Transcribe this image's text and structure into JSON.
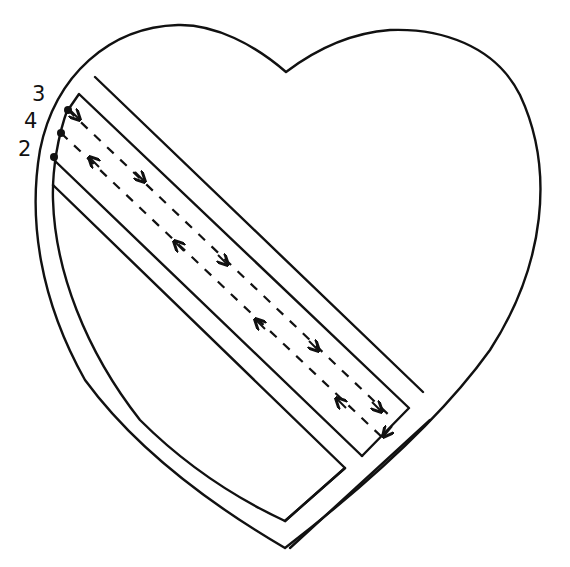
{
  "diagram": {
    "title": "",
    "shape": "heart",
    "stroke_color": "#111111",
    "background": "#ffffff",
    "labels": [
      {
        "id": "label-3",
        "text": "3",
        "x": 32,
        "y": 101
      },
      {
        "id": "label-4",
        "text": "4",
        "x": 24,
        "y": 128
      },
      {
        "id": "label-2",
        "text": "2",
        "x": 18,
        "y": 156
      }
    ],
    "points": [
      {
        "id": "point-3",
        "x": 68,
        "y": 110
      },
      {
        "id": "point-4",
        "x": 61,
        "y": 133
      },
      {
        "id": "point-2",
        "x": 54,
        "y": 157
      }
    ],
    "arrows_forward": [
      {
        "x": 77,
        "y": 117,
        "dir": "down-right"
      },
      {
        "x": 142,
        "y": 178,
        "dir": "down-right"
      },
      {
        "x": 225,
        "y": 262,
        "dir": "down-right"
      },
      {
        "x": 316,
        "y": 348,
        "dir": "down-right"
      },
      {
        "x": 379,
        "y": 409,
        "dir": "down-right"
      }
    ],
    "arrows_backward": [
      {
        "x": 92,
        "y": 160,
        "dir": "up-left"
      },
      {
        "x": 177,
        "y": 244,
        "dir": "up-left"
      },
      {
        "x": 258,
        "y": 322,
        "dir": "up-left"
      },
      {
        "x": 339,
        "y": 401,
        "dir": "up-left"
      },
      {
        "x": 387,
        "y": 432,
        "dir": "down-left"
      }
    ]
  }
}
